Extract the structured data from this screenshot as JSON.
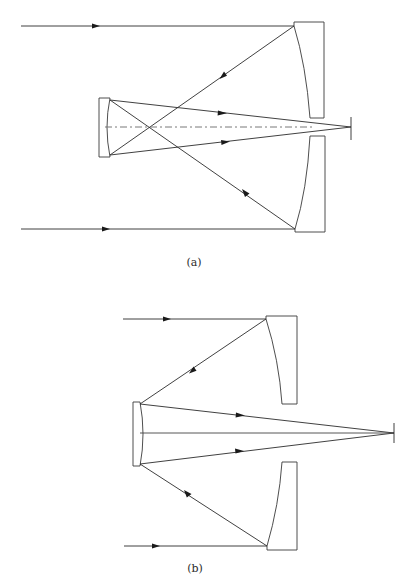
{
  "figure": {
    "panels": [
      {
        "id": "a",
        "label": "(a)",
        "description": "Telescope with concave primary mirror and concave secondary; rays cross before secondary, converge to focus beyond primary aperture",
        "axis_style": "dash-dot"
      },
      {
        "id": "b",
        "label": "(b)",
        "description": "Telescope with concave primary and convex secondary; rays reflect to secondary and converge to focus beyond primary aperture",
        "axis_style": "solid"
      }
    ],
    "colors": {
      "line": "#2b2b2b",
      "background": "#ffffff",
      "axis": "#6a6a6a"
    }
  }
}
